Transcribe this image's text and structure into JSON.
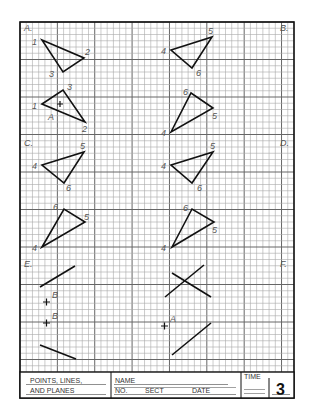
{
  "worksheet": {
    "section_labels": [
      "A.",
      "B.",
      "C.",
      "D.",
      "E.",
      "F."
    ],
    "problems": {
      "A": {
        "figure_top": {
          "vertex_labels": [
            "1",
            "2",
            "3"
          ]
        },
        "figure_bottom": {
          "vertex_labels": [
            "1",
            "2",
            "3"
          ],
          "point_label": "A"
        }
      },
      "B": {
        "figure_top": {
          "vertex_labels": [
            "4",
            "5",
            "6"
          ]
        },
        "figure_bottom": {
          "vertex_labels": [
            "4",
            "5",
            "6"
          ]
        }
      },
      "C": {
        "figure_top": {
          "vertex_labels": [
            "4",
            "5",
            "6"
          ]
        },
        "figure_bottom": {
          "vertex_labels": [
            "4",
            "5",
            "6"
          ]
        }
      },
      "D": {
        "figure_top": {
          "vertex_labels": [
            "4",
            "5",
            "6"
          ]
        },
        "figure_bottom": {
          "vertex_labels": [
            "4",
            "5",
            "6"
          ]
        }
      },
      "E": {
        "point_labels": [
          "B",
          "B"
        ]
      },
      "F": {
        "point_labels": [
          "A"
        ]
      }
    }
  },
  "title_block": {
    "title_line1": "POINTS, LINES,",
    "title_line2": "AND PLANES",
    "name_label": "NAME",
    "no_label": "NO.",
    "sect_label": "SECT",
    "date_label": "DATE",
    "time_label": "TIME",
    "sheet_number": "3"
  }
}
